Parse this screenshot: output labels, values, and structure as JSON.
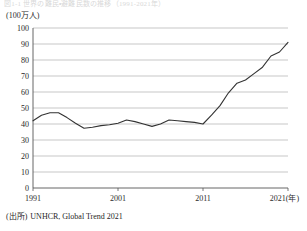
{
  "figure": {
    "title_strip": "図1-1 世界の難民・避難民数の推移（1991-2021年）",
    "unit_label": "(100万人)",
    "source_label": "(出所)",
    "source_text": "UNHCR, Global Trend 2021"
  },
  "colors": {
    "line": "#333333",
    "grid": "#b0b0b0",
    "axis": "#555555",
    "text": "#1f1f1f",
    "background": "#ffffff"
  },
  "chart_data": {
    "type": "line",
    "title": "",
    "xlabel": "年",
    "ylabel": "(100万人)",
    "xlim": [
      1991,
      2021
    ],
    "ylim": [
      0,
      100
    ],
    "ytick_step": 10,
    "yticks": [
      0,
      10,
      20,
      30,
      40,
      50,
      60,
      70,
      80,
      90,
      100
    ],
    "xticks": [
      1991,
      2001,
      2011,
      2021
    ],
    "xtick_labels": [
      "1991",
      "2001",
      "2011",
      "2021(年)"
    ],
    "grid": "horizontal",
    "legend": "none",
    "series": [
      {
        "name": "強制移動させられた人々の総数",
        "x": [
          1991,
          1992,
          1993,
          1994,
          1995,
          1996,
          1997,
          1998,
          1999,
          2000,
          2001,
          2002,
          2003,
          2004,
          2005,
          2006,
          2007,
          2008,
          2009,
          2010,
          2011,
          2012,
          2013,
          2014,
          2015,
          2016,
          2017,
          2018,
          2019,
          2020,
          2021
        ],
        "values": [
          42.0,
          45.5,
          47.0,
          47.0,
          44.0,
          40.5,
          37.3,
          38.0,
          39.0,
          39.5,
          40.5,
          42.5,
          41.5,
          40.0,
          38.5,
          40.0,
          42.5,
          42.0,
          41.5,
          41.0,
          40.0,
          45.5,
          51.5,
          59.5,
          65.5,
          67.5,
          71.5,
          75.5,
          82.5,
          85.0,
          91.0
        ]
      }
    ]
  },
  "axis_geometry": {
    "plot_left": 33,
    "plot_right": 288,
    "plot_top": 6,
    "plot_bottom": 166
  }
}
